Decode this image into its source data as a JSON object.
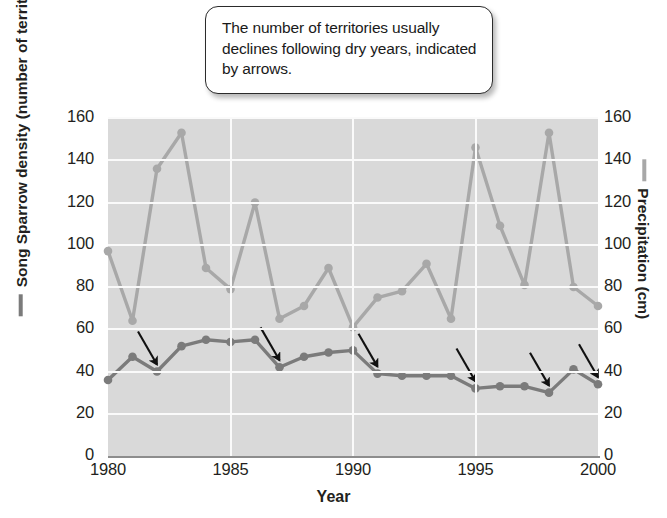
{
  "callout": {
    "text": "The number of territories usually declines following dry years, indicated by arrows."
  },
  "axes": {
    "x_title": "Year",
    "left_title": "Song Sparrow density (number of territories)",
    "right_title": "Precipitation (cm)",
    "y_ticks": [
      "0",
      "20",
      "40",
      "60",
      "80",
      "100",
      "120",
      "140",
      "160"
    ],
    "x_ticks": [
      "1980",
      "1985",
      "1990",
      "1995",
      "2000"
    ]
  },
  "colors": {
    "plot_background": "#d9d9d9",
    "grid": "#fafafa",
    "sparrow_line": "#7b7b7b",
    "precipitation_line": "#a8a8a8",
    "arrow": "#111111",
    "text": "#231f20"
  },
  "chart_data": {
    "type": "line",
    "title": "",
    "xlabel": "Year",
    "ylabel": "Song Sparrow density (number of territories)",
    "y2label": "Precipitation (cm)",
    "xlim": [
      1980,
      2000
    ],
    "ylim": [
      0,
      160
    ],
    "y2lim": [
      0,
      160
    ],
    "grid": true,
    "legend": "axis-titles",
    "x": [
      1980,
      1981,
      1982,
      1983,
      1984,
      1985,
      1986,
      1987,
      1988,
      1989,
      1990,
      1991,
      1992,
      1993,
      1994,
      1995,
      1996,
      1997,
      1998,
      1999,
      2000
    ],
    "series": [
      {
        "name": "Song Sparrow density (number of territories)",
        "axis": "left",
        "color": "#7b7b7b",
        "values": [
          36,
          47,
          40,
          52,
          55,
          54,
          55,
          42,
          47,
          49,
          50,
          39,
          38,
          38,
          38,
          32,
          33,
          33,
          30,
          41,
          34
        ]
      },
      {
        "name": "Precipitation (cm)",
        "axis": "right",
        "color": "#a8a8a8",
        "values": [
          97,
          64,
          136,
          153,
          89,
          79,
          120,
          65,
          71,
          89,
          61,
          75,
          78,
          91,
          65,
          146,
          109,
          81,
          153,
          80,
          71
        ]
      }
    ],
    "annotations": {
      "type": "arrows",
      "description": "Arrows indicate declines in territory count following dry years",
      "pointing_at_years": [
        1982,
        1987,
        1991,
        1995,
        1998,
        2000
      ]
    }
  }
}
